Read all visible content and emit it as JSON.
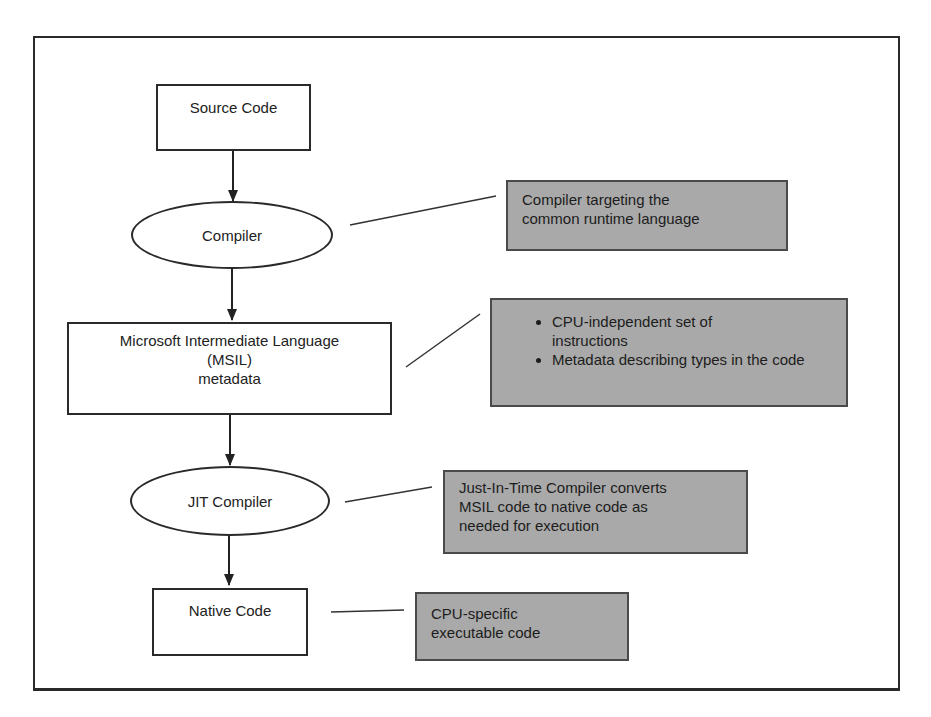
{
  "diagram": {
    "title": "",
    "nodes": [
      {
        "id": "source",
        "shape": "rectangle",
        "label": "Source Code"
      },
      {
        "id": "compiler",
        "shape": "ellipse",
        "label": "Compiler"
      },
      {
        "id": "msil",
        "shape": "rectangle",
        "lines": [
          "Microsoft Intermediate Language",
          "(MSIL)",
          "metadata"
        ]
      },
      {
        "id": "jit",
        "shape": "ellipse",
        "label": "JIT Compiler"
      },
      {
        "id": "native",
        "shape": "rectangle",
        "label": "Native Code"
      }
    ],
    "edges": [
      {
        "from": "source",
        "to": "compiler"
      },
      {
        "from": "compiler",
        "to": "msil"
      },
      {
        "from": "msil",
        "to": "jit"
      },
      {
        "from": "jit",
        "to": "native"
      }
    ],
    "annotations": [
      {
        "attached_to": "compiler",
        "lines": [
          "Compiler targeting the",
          "common runtime language"
        ]
      },
      {
        "attached_to": "msil",
        "bullets": [
          "CPU-independent set of instructions",
          "Metadata describing types in the code"
        ]
      },
      {
        "attached_to": "jit",
        "lines": [
          "Just-In-Time Compiler converts",
          "MSIL code to native code as",
          "needed for execution"
        ]
      },
      {
        "attached_to": "native",
        "lines": [
          "CPU-specific",
          "executable code"
        ]
      }
    ],
    "colors": {
      "note_fill": "#a9a9a9",
      "stroke": "#2a2a2a",
      "background": "#ffffff"
    }
  }
}
